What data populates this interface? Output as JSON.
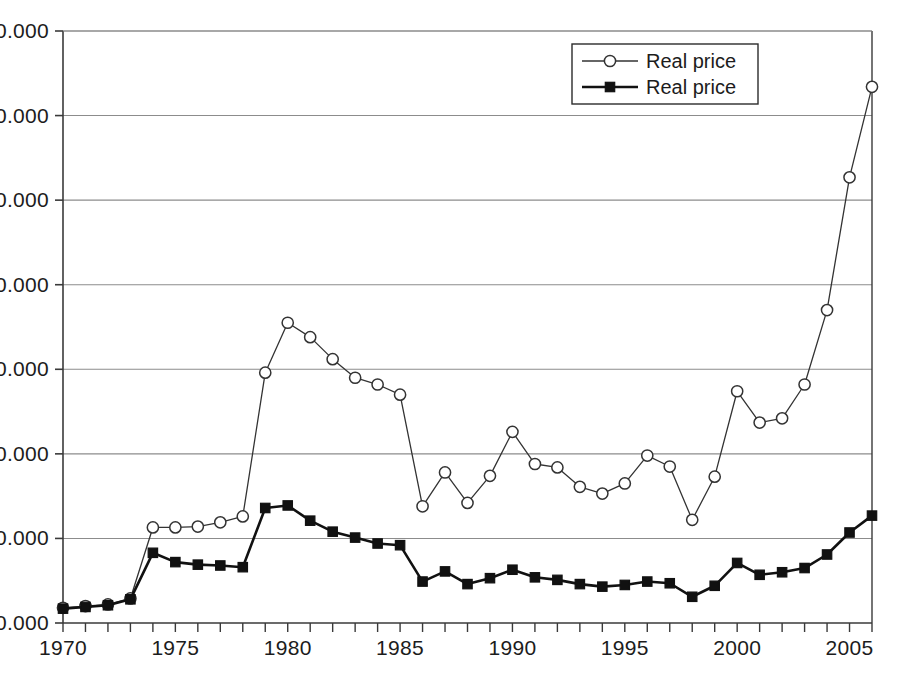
{
  "chart_data": {
    "type": "line",
    "title": "",
    "subtitle": "",
    "xlabel": "",
    "ylabel": "",
    "xlim": [
      1970,
      2006
    ],
    "ylim": [
      0,
      70
    ],
    "grid": "horizontal",
    "legend_position": "top-right",
    "x": [
      1970,
      1971,
      1972,
      1973,
      1974,
      1975,
      1976,
      1977,
      1978,
      1979,
      1980,
      1981,
      1982,
      1983,
      1984,
      1985,
      1986,
      1987,
      1988,
      1989,
      1990,
      1991,
      1992,
      1993,
      1994,
      1995,
      1996,
      1997,
      1998,
      1999,
      2000,
      2001,
      2002,
      2003,
      2004,
      2005,
      2006
    ],
    "xticks": [
      1970,
      1975,
      1980,
      1985,
      1990,
      1995,
      2000,
      2005
    ],
    "xticklabels": [
      "1970",
      "1975",
      "1980",
      "1985",
      "1990",
      "1995",
      "2000",
      "2005"
    ],
    "yticks": [
      0,
      10,
      20,
      30,
      40,
      50,
      60,
      70
    ],
    "yticklabels": [
      "0.000",
      "10.000",
      "20.000",
      "30.000",
      "40.000",
      "50.000",
      "60.000",
      "70.000"
    ],
    "series": [
      {
        "name": "Real price",
        "marker": "open-circle",
        "line_color": "#333333",
        "marker_fill": "#ffffff",
        "line_width": 1.3,
        "values": [
          1.8,
          2.0,
          2.2,
          2.9,
          11.3,
          11.3,
          11.4,
          11.9,
          12.6,
          29.6,
          35.5,
          33.8,
          31.2,
          29.0,
          28.2,
          27.0,
          13.8,
          17.8,
          14.2,
          17.4,
          22.6,
          18.8,
          18.4,
          16.1,
          15.3,
          16.5,
          19.8,
          18.5,
          12.2,
          17.3,
          27.4,
          23.7,
          24.2,
          28.2,
          37.0,
          52.7,
          63.4
        ]
      },
      {
        "name": "Real price",
        "marker": "filled-square",
        "line_color": "#111111",
        "marker_fill": "#111111",
        "line_width": 2.6,
        "values": [
          1.7,
          1.9,
          2.1,
          2.8,
          8.3,
          7.2,
          6.9,
          6.8,
          6.6,
          13.6,
          13.9,
          12.1,
          10.8,
          10.1,
          9.4,
          9.2,
          4.9,
          6.1,
          4.6,
          5.3,
          6.3,
          5.4,
          5.1,
          4.6,
          4.3,
          4.5,
          4.9,
          4.7,
          3.1,
          4.4,
          7.1,
          5.7,
          6.0,
          6.5,
          8.1,
          10.7,
          12.7
        ]
      }
    ]
  },
  "legend": {
    "entries": [
      {
        "label": "Real price",
        "marker": "open-circle"
      },
      {
        "label": "Real price",
        "marker": "filled-square"
      }
    ]
  },
  "colors": {
    "background": "#ffffff",
    "axis": "#3a3a3a",
    "gridline": "#8c8c8c",
    "series_open": "#333333",
    "series_filled": "#111111",
    "text": "#1c1c1c"
  },
  "caption": {
    "text": ""
  }
}
